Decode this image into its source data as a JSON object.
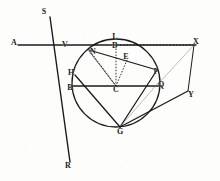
{
  "figure": {
    "domain": "Diagram",
    "kind": "geometry-construction",
    "width": 220,
    "height": 181,
    "background_color": "#fdfdfc",
    "ink_color": "#1b1b1b",
    "faint_ink_color": "#6e6e6e"
  },
  "circle": {
    "label": "main-circle",
    "center_label": "C",
    "cx": 116,
    "cy": 83,
    "r": 44,
    "stroke": "#1b1b1b",
    "stroke_width": 1.3
  },
  "points": [
    {
      "id": "S",
      "label": "S",
      "x": 44,
      "y": 12
    },
    {
      "id": "A",
      "label": "A",
      "x": 14,
      "y": 43
    },
    {
      "id": "X",
      "label": "X",
      "x": 196,
      "y": 42
    },
    {
      "id": "L",
      "label": "L",
      "x": 115,
      "y": 37
    },
    {
      "id": "D",
      "label": "D",
      "x": 115,
      "y": 46
    },
    {
      "id": "V",
      "label": "V",
      "x": 65,
      "y": 45
    },
    {
      "id": "N",
      "label": "N",
      "x": 93,
      "y": 52
    },
    {
      "id": "E",
      "label": "E",
      "x": 126,
      "y": 57
    },
    {
      "id": "H",
      "label": "H",
      "x": 71,
      "y": 73
    },
    {
      "id": "F",
      "label": "F",
      "x": 156,
      "y": 72
    },
    {
      "id": "B",
      "label": "B",
      "x": 70,
      "y": 88
    },
    {
      "id": "C",
      "label": "C",
      "x": 116,
      "y": 90
    },
    {
      "id": "Q",
      "label": "Q",
      "x": 161,
      "y": 85
    },
    {
      "id": "Y",
      "label": "Y",
      "x": 191,
      "y": 95
    },
    {
      "id": "G",
      "label": "G",
      "x": 120,
      "y": 132
    },
    {
      "id": "R",
      "label": "R",
      "x": 68,
      "y": 166
    }
  ],
  "segments": [
    {
      "name": "line-A-X-horizontal",
      "from": "A",
      "to": "X",
      "x1": 18,
      "y1": 45,
      "x2": 196,
      "y2": 45,
      "style": "solid",
      "width": 1.4
    },
    {
      "name": "line-S-through-V-to-G-R",
      "from": "S",
      "to": "R",
      "x1": 50,
      "y1": 17,
      "x2": 70,
      "y2": 162,
      "style": "solid",
      "width": 1.4
    },
    {
      "name": "line-N-to-F-chord",
      "from": "N",
      "to": "F",
      "x1": 89,
      "y1": 50,
      "x2": 157,
      "y2": 70,
      "style": "solid",
      "width": 1.3
    },
    {
      "name": "line-B-to-Q-diameter",
      "from": "B",
      "to": "Q",
      "x1": 73,
      "y1": 86,
      "x2": 162,
      "y2": 86,
      "style": "solid",
      "width": 1.4
    },
    {
      "name": "line-H-to-G-chord",
      "from": "H",
      "to": "G",
      "x1": 75,
      "y1": 75,
      "x2": 120,
      "y2": 127,
      "style": "solid",
      "width": 1.3
    },
    {
      "name": "line-F-to-G-chord",
      "from": "F",
      "to": "G",
      "x1": 157,
      "y1": 70,
      "x2": 120,
      "y2": 127,
      "style": "solid",
      "width": 1.3
    },
    {
      "name": "line-G-to-Y-ray",
      "from": "G",
      "to": "Y",
      "x1": 120,
      "y1": 127,
      "x2": 188,
      "y2": 91,
      "style": "solid",
      "width": 1.4
    },
    {
      "name": "line-X-to-Y-ray",
      "from": "X",
      "to": "Y",
      "x1": 194,
      "y1": 45,
      "x2": 188,
      "y2": 91,
      "style": "solid",
      "width": 1.0
    },
    {
      "name": "line-X-to-Q-faint",
      "from": "X",
      "to": "Q",
      "x1": 194,
      "y1": 45,
      "x2": 158,
      "y2": 84,
      "style": "faint",
      "width": 0.8
    },
    {
      "name": "line-G-to-Q-faint",
      "from": "G",
      "to": "Q",
      "x1": 120,
      "y1": 127,
      "x2": 159,
      "y2": 82,
      "style": "faint",
      "width": 0.8
    },
    {
      "name": "line-D-to-X-dotted",
      "from": "D",
      "to": "X",
      "x1": 117,
      "y1": 45,
      "x2": 193,
      "y2": 45,
      "style": "dotted",
      "width": 1.0
    },
    {
      "name": "radius-C-to-N-dotted",
      "from": "C",
      "to": "N",
      "x1": 116,
      "y1": 86,
      "x2": 90,
      "y2": 51,
      "style": "dotted",
      "width": 0.9
    },
    {
      "name": "radius-C-to-D-dotted",
      "from": "C",
      "to": "D",
      "x1": 116,
      "y1": 86,
      "x2": 116,
      "y2": 42,
      "style": "dotted",
      "width": 0.9
    },
    {
      "name": "radius-C-to-E-dotted",
      "from": "C",
      "to": "E",
      "x1": 116,
      "y1": 86,
      "x2": 127,
      "y2": 60,
      "style": "dotted",
      "width": 0.9
    },
    {
      "name": "radius-C-to-N-solid",
      "from": "C",
      "to": "N",
      "x1": 116,
      "y1": 86,
      "x2": 89,
      "y2": 51,
      "style": "solid",
      "width": 0.7
    }
  ],
  "caption": ""
}
